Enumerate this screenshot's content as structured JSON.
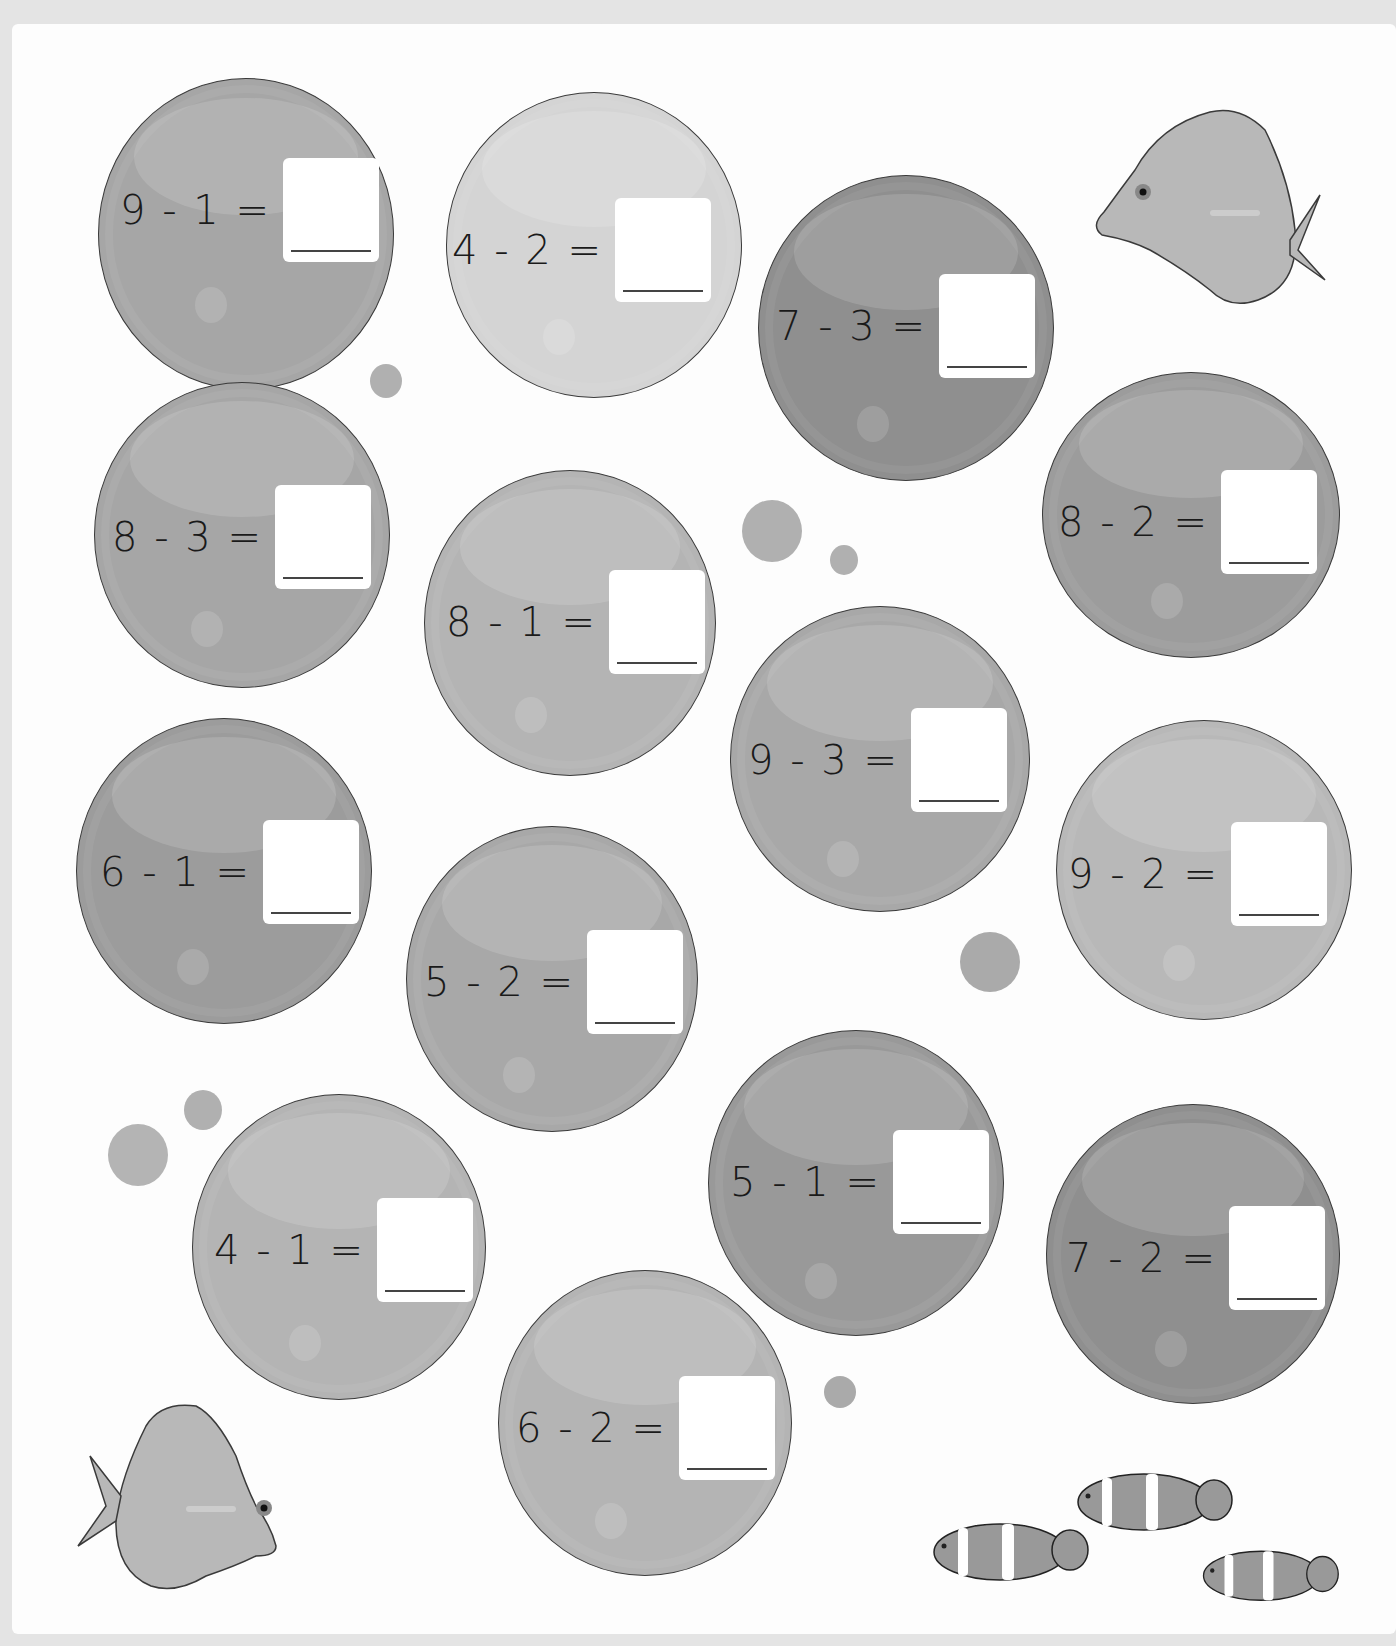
{
  "worksheet": {
    "type": "subtraction-within-10",
    "problems": [
      {
        "id": 1,
        "expression": "9 - 1 =",
        "answer": ""
      },
      {
        "id": 2,
        "expression": "4 - 2 =",
        "answer": ""
      },
      {
        "id": 3,
        "expression": "7 - 3 =",
        "answer": ""
      },
      {
        "id": 4,
        "expression": "8 - 3 =",
        "answer": ""
      },
      {
        "id": 5,
        "expression": "8 - 1 =",
        "answer": ""
      },
      {
        "id": 6,
        "expression": "8 - 2 =",
        "answer": ""
      },
      {
        "id": 7,
        "expression": "9 - 3 =",
        "answer": ""
      },
      {
        "id": 8,
        "expression": "6 - 1 =",
        "answer": ""
      },
      {
        "id": 9,
        "expression": "9 - 2 =",
        "answer": ""
      },
      {
        "id": 10,
        "expression": "5 - 2 =",
        "answer": ""
      },
      {
        "id": 11,
        "expression": "5 - 1 =",
        "answer": ""
      },
      {
        "id": 12,
        "expression": "4 - 1 =",
        "answer": ""
      },
      {
        "id": 13,
        "expression": "7 - 2 =",
        "answer": ""
      },
      {
        "id": 14,
        "expression": "6 - 2 =",
        "answer": ""
      }
    ],
    "decorations": [
      "tang-fish-top-right",
      "tang-fish-bottom-left",
      "clownfish-school-bottom-right",
      "small-bubbles"
    ]
  },
  "colors": {
    "background": "#e4e4e4",
    "page": "#fdfdfd",
    "bubble_dark": "#8f8f8f",
    "bubble_mid": "#a8a8a8",
    "bubble_light": "#bdbdbd",
    "bubble_lightest": "#d6d6d6",
    "outline": "#3a3a3a"
  }
}
